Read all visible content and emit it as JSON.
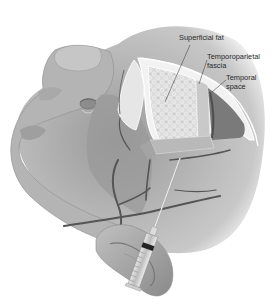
{
  "figure": {
    "labels": [
      {
        "id": "superficial_fat",
        "lines": [
          "Superficial fat"
        ]
      },
      {
        "id": "temporoparietal_fascia",
        "lines": [
          "Temporoparietal",
          "fascia"
        ]
      },
      {
        "id": "temporal_space",
        "lines": [
          "Temporal",
          "space"
        ]
      }
    ],
    "colors": {
      "background": "#ffffff",
      "skin_light": "#d4d4d4",
      "skin_mid": "#a8a8a8",
      "skin_dark": "#6e6e6e",
      "fat_layer": "#e6e6e6",
      "fascia_line": "#ffffff",
      "vessel": "#555555",
      "label_text": "#2a2a2a"
    },
    "instrument": "syringe"
  }
}
